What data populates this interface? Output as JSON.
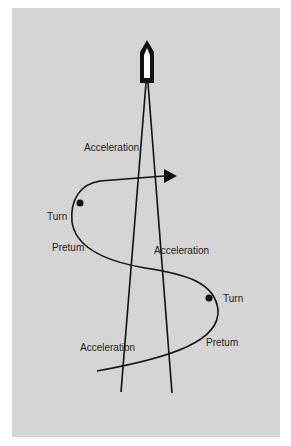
{
  "diagram": {
    "background_color": "#d5d5d5",
    "stroke_color": "#111111",
    "labels": {
      "acceleration_top": "Acceleration",
      "turn_left": "Turn",
      "preturn_left": "Pretum",
      "acceleration_middle": "Acceleration",
      "turn_right": "Turn",
      "acceleration_bottom": "Acceleration",
      "preturn_right": "Pretum"
    },
    "icons": {
      "boat": "boat-icon",
      "arrow": "arrowhead-icon",
      "turn_markers": [
        "turn-point-dot",
        "turn-point-dot"
      ]
    }
  }
}
